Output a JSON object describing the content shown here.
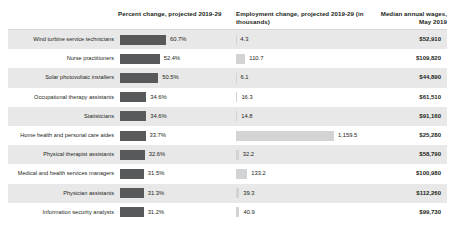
{
  "header": {
    "percent_change": "Percent change, projected 2019-29",
    "employment_change": "Employment change, projected 2019-29 (in thousands)",
    "median_wages": "Median annual wages, May 2019"
  },
  "colors": {
    "percent_bar": "#58595b",
    "employment_bar": "#d2d3d5",
    "row_band": "#e8e8e8",
    "text": "#231f20"
  },
  "chart_data": {
    "type": "bar",
    "title": "",
    "xlabel": "",
    "ylabel": "",
    "grid": false,
    "legend": "none",
    "categories": [
      "Wind turbine service technicians",
      "Nurse practitioners",
      "Solar photovoltaic installers",
      "Occupational therapy assistants",
      "Statisticians",
      "Home health and personal care aides",
      "Physical therapist assistants",
      "Medical and health services managers",
      "Physician assistants",
      "Information security analysts"
    ],
    "series": [
      {
        "name": "Percent change, projected 2019-29",
        "values": [
          60.7,
          52.4,
          50.5,
          34.6,
          34.6,
          33.7,
          32.6,
          31.5,
          31.3,
          31.2
        ],
        "labels": [
          "60.7%",
          "52.4%",
          "50.5%",
          "34.6%",
          "34.6%",
          "33.7%",
          "32.6%",
          "31.5%",
          "31.3%",
          "31.2%"
        ],
        "max": 60.7
      },
      {
        "name": "Employment change, projected 2019-29 (in thousands)",
        "values": [
          4.3,
          110.7,
          6.1,
          16.3,
          14.8,
          1159.5,
          32.2,
          133.2,
          39.3,
          40.9
        ],
        "labels": [
          "4.3",
          "110.7",
          "6.1",
          "16.3",
          "14.8",
          "1,159.5",
          "32.2",
          "133.2",
          "39.3",
          "40.9"
        ],
        "max": 1159.5
      },
      {
        "name": "Median annual wages, May 2019",
        "labels": [
          "$52,910",
          "$109,820",
          "$44,890",
          "$61,510",
          "$91,160",
          "$25,280",
          "$58,790",
          "$100,980",
          "$112,260",
          "$99,730"
        ]
      }
    ]
  }
}
